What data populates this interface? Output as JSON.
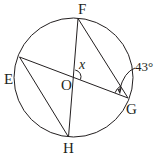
{
  "diagram": {
    "type": "circle-geometry",
    "circle": {
      "center_label": "O",
      "cx": 73.5,
      "cy": 77.5,
      "r": 59.5
    },
    "points": {
      "F": {
        "label": "F",
        "x": 78,
        "y": 18.5
      },
      "E": {
        "label": "E",
        "x": 19.5,
        "y": 57
      },
      "H": {
        "label": "H",
        "x": 68.5,
        "y": 137
      },
      "G": {
        "label": "G",
        "x": 128,
        "y": 98
      },
      "O": {
        "label": "O",
        "x": 74,
        "y": 77
      }
    },
    "segments": [
      "FH",
      "EG",
      "EH",
      "FG"
    ],
    "angles": {
      "x": {
        "label": "x",
        "vertex": "O",
        "between": [
          "OF",
          "OG"
        ]
      },
      "given": {
        "label": "43°",
        "vertex": "G",
        "between": [
          "GF",
          "GE"
        ],
        "value_deg": 43
      }
    },
    "colors": {
      "stroke": "#231f20",
      "background": "#ffffff"
    }
  }
}
